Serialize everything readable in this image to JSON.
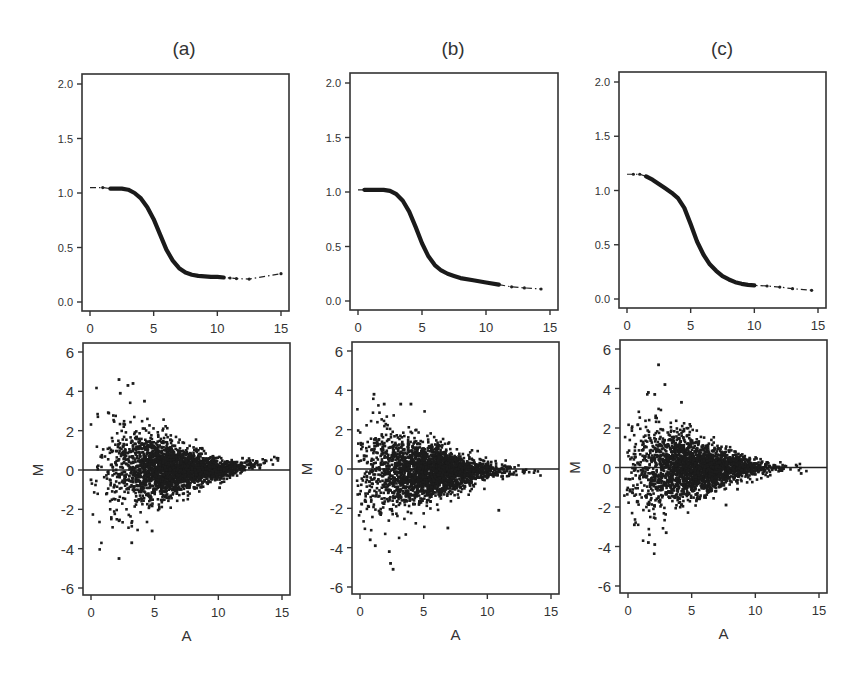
{
  "figure": {
    "panels": [
      "(a)",
      "(b)",
      "(c)"
    ]
  },
  "chart_data": [
    {
      "panel": "(a)",
      "position": "top",
      "type": "line",
      "title": "(a)",
      "xlabel": "",
      "ylabel": "",
      "xlim": [
        -0.5,
        15.5
      ],
      "ylim": [
        -0.05,
        2.05
      ],
      "xticks": [
        0,
        5,
        10,
        15
      ],
      "yticks": [
        0.0,
        0.5,
        1.0,
        1.5,
        2.0
      ],
      "ytick_labels": [
        "0.0",
        "0.5",
        "1.0",
        "1.5",
        "2.0"
      ],
      "grid": false,
      "series": [
        {
          "name": "normalization curve",
          "style": "thick solid with dash-dot extremes",
          "x": [
            0,
            1,
            1.6,
            2,
            2.5,
            3,
            3.5,
            4,
            4.5,
            5,
            5.5,
            6,
            6.5,
            7,
            7.5,
            8,
            8.5,
            9,
            9.5,
            10,
            10.5,
            11,
            11.5,
            12.5,
            15
          ],
          "y": [
            1.05,
            1.05,
            1.04,
            1.04,
            1.04,
            1.03,
            1.0,
            0.95,
            0.87,
            0.76,
            0.62,
            0.48,
            0.38,
            0.31,
            0.27,
            0.25,
            0.24,
            0.235,
            0.23,
            0.23,
            0.225,
            0.22,
            0.215,
            0.21,
            0.26
          ],
          "solid_range": [
            1.6,
            10.5
          ]
        }
      ]
    },
    {
      "panel": "(b)",
      "position": "top",
      "type": "line",
      "title": "(b)",
      "xlabel": "",
      "ylabel": "",
      "xlim": [
        -0.5,
        15.5
      ],
      "ylim": [
        -0.05,
        2.05
      ],
      "xticks": [
        0,
        5,
        10,
        15
      ],
      "yticks": [
        0.0,
        0.5,
        1.0,
        1.5,
        2.0
      ],
      "ytick_labels": [
        "0.0",
        "0.5",
        "1.0",
        "1.5",
        "2.0"
      ],
      "grid": false,
      "series": [
        {
          "name": "normalization curve",
          "style": "thick solid with dash-dot extremes",
          "x": [
            0,
            0.5,
            1,
            1.5,
            2,
            2.5,
            3,
            3.5,
            4,
            4.5,
            5,
            5.5,
            6,
            6.5,
            7,
            7.5,
            8,
            9,
            10,
            11,
            12,
            13,
            14.3
          ],
          "y": [
            1.02,
            1.02,
            1.02,
            1.02,
            1.02,
            1.01,
            0.98,
            0.92,
            0.82,
            0.68,
            0.53,
            0.41,
            0.33,
            0.28,
            0.25,
            0.23,
            0.21,
            0.19,
            0.17,
            0.15,
            0.13,
            0.12,
            0.11
          ],
          "solid_range": [
            0.5,
            11
          ]
        }
      ]
    },
    {
      "panel": "(c)",
      "position": "top",
      "type": "line",
      "title": "(c)",
      "xlabel": "",
      "ylabel": "",
      "xlim": [
        -0.5,
        15.5
      ],
      "ylim": [
        -0.05,
        2.05
      ],
      "xticks": [
        0,
        5,
        10,
        15
      ],
      "yticks": [
        0.0,
        0.5,
        1.0,
        1.5,
        2.0
      ],
      "ytick_labels": [
        "0.0",
        "0.5",
        "1.0",
        "1.5",
        "2.0"
      ],
      "grid": false,
      "series": [
        {
          "name": "normalization curve",
          "style": "thick solid with dash-dot extremes",
          "x": [
            0,
            0.5,
            1,
            1.5,
            2,
            2.5,
            3,
            3.5,
            4,
            4.5,
            5,
            5.5,
            6,
            6.5,
            7,
            7.5,
            8,
            8.5,
            9,
            9.5,
            10,
            11,
            12,
            13,
            14.5
          ],
          "y": [
            1.15,
            1.15,
            1.15,
            1.13,
            1.1,
            1.06,
            1.02,
            0.98,
            0.93,
            0.84,
            0.69,
            0.53,
            0.41,
            0.32,
            0.26,
            0.21,
            0.18,
            0.155,
            0.14,
            0.13,
            0.125,
            0.12,
            0.11,
            0.095,
            0.08
          ],
          "solid_range": [
            1.5,
            10.5
          ]
        }
      ]
    },
    {
      "panel": "(a)",
      "position": "bottom",
      "type": "scatter",
      "xlabel": "A",
      "ylabel": "M",
      "xlim": [
        -0.6,
        15.6
      ],
      "ylim": [
        -6.4,
        6.4
      ],
      "xticks": [
        0,
        5,
        10,
        15
      ],
      "yticks": [
        -6,
        -4,
        -2,
        0,
        2,
        4,
        6
      ],
      "reference_line": {
        "y": 0
      },
      "grid": false,
      "distribution": {
        "n_points": 2600,
        "center_A": 6.5,
        "spread_A": 2.6,
        "trend": "slightly positive for A>11, rising to ~0.5 at A=14.5",
        "spread_M_at_low_A": 1.6,
        "spread_M_at_high_A": 0.15,
        "A_range": [
          0,
          14.8
        ]
      },
      "notable_points": [
        [
          2.2,
          4.6
        ],
        [
          2.9,
          4.3
        ],
        [
          3.3,
          4.4
        ],
        [
          2.3,
          3.9
        ],
        [
          4.2,
          3.5
        ],
        [
          2.2,
          -4.5
        ],
        [
          3.2,
          -3.7
        ],
        [
          4.8,
          -3.1
        ],
        [
          0.0,
          -0.5
        ],
        [
          14.6,
          0.6
        ],
        [
          10.1,
          -0.9
        ],
        [
          11.9,
          0.6
        ]
      ]
    },
    {
      "panel": "(b)",
      "position": "bottom",
      "type": "scatter",
      "xlabel": "A",
      "ylabel": "M",
      "xlim": [
        -0.6,
        15.6
      ],
      "ylim": [
        -6.4,
        6.4
      ],
      "xticks": [
        0,
        5,
        10,
        15
      ],
      "yticks": [
        -6,
        -4,
        -2,
        0,
        2,
        4,
        6
      ],
      "reference_line": {
        "y": 0
      },
      "grid": false,
      "distribution": {
        "n_points": 2600,
        "center_A": 5.5,
        "spread_A": 2.7,
        "trend": "slightly negative, ~-0.2 around A 4-7 and A>12",
        "spread_M_at_low_A": 1.5,
        "spread_M_at_high_A": 0.12,
        "A_range": [
          -0.3,
          14.2
        ]
      },
      "notable_points": [
        [
          1.1,
          3.8
        ],
        [
          1.9,
          3.3
        ],
        [
          3.2,
          3.3
        ],
        [
          4.0,
          3.3
        ],
        [
          2.6,
          -5.1
        ],
        [
          2.4,
          -4.8
        ],
        [
          2.3,
          -4.2
        ],
        [
          1.2,
          -3.9
        ],
        [
          10.9,
          -2.1
        ],
        [
          6.9,
          -3.0
        ],
        [
          0.8,
          -3.6
        ]
      ]
    },
    {
      "panel": "(c)",
      "position": "bottom",
      "type": "scatter",
      "xlabel": "A",
      "ylabel": "M",
      "xlim": [
        -0.6,
        15.6
      ],
      "ylim": [
        -6.4,
        6.4
      ],
      "xticks": [
        0,
        5,
        10,
        15
      ],
      "yticks": [
        -6,
        -4,
        -2,
        0,
        2,
        4,
        6
      ],
      "reference_line": {
        "y": 0
      },
      "grid": false,
      "distribution": {
        "n_points": 2600,
        "center_A": 5.5,
        "spread_A": 2.6,
        "trend": "centered on 0",
        "spread_M_at_low_A": 1.5,
        "spread_M_at_high_A": 0.1,
        "A_range": [
          -0.3,
          14.3
        ]
      },
      "notable_points": [
        [
          2.4,
          5.2
        ],
        [
          2.9,
          4.2
        ],
        [
          1.6,
          3.8
        ],
        [
          2.1,
          3.7
        ],
        [
          4.2,
          3.3
        ],
        [
          2.1,
          -3.9
        ],
        [
          1.6,
          -3.8
        ],
        [
          3.0,
          -3.3
        ],
        [
          0.5,
          -2.9
        ],
        [
          7.7,
          -1.9
        ],
        [
          8.6,
          -1.1
        ],
        [
          13.6,
          -0.3
        ]
      ]
    }
  ]
}
